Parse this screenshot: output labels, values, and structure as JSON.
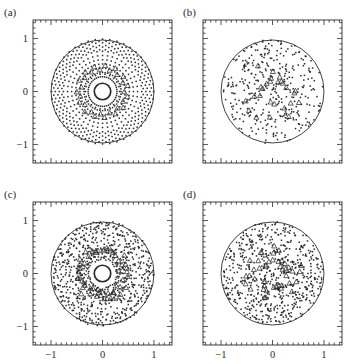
{
  "figure": {
    "layout": "2x2 grid of square scatter panels",
    "background_color": "#ffffff",
    "ink_color": "#2b2b2b"
  },
  "chart_data": [
    {
      "type": "scatter",
      "panel": "a",
      "label": "(a)",
      "title": "",
      "xlabel": "",
      "ylabel": "",
      "xlim": [
        -1.35,
        1.35
      ],
      "ylim": [
        -1.35,
        1.35
      ],
      "xticks": [
        -1,
        0,
        1
      ],
      "yticks": [
        -1,
        0,
        1
      ],
      "xticklabels": [
        "",
        "",
        ""
      ],
      "yticklabels": [
        "1",
        "0",
        "-1"
      ],
      "minor_tick_step": 0.1,
      "grid": false,
      "legend": "none",
      "annotations": [
        "unit boundary circle radius 1.0",
        "bold solid inner circle radius 0.16",
        "dotted ring of points radius 0.28",
        "regular polar lattice: 44 angular spokes",
        "triangle markers on ring radius 0.42 to 0.50"
      ],
      "boundary_circle_radius": 1.0,
      "inner_circle_radius": 0.16,
      "dotted_ring_radius": 0.28,
      "n_spokes": 44,
      "point_radii": [
        0.36,
        0.44,
        0.52,
        0.6,
        0.68,
        0.76,
        0.84,
        0.92,
        0.99
      ],
      "triangle_ring_radii": [
        0.43,
        0.5
      ],
      "n_triangles": 30,
      "jitter": 0.0,
      "marker_dot": "dot",
      "marker_special": "open-triangle"
    },
    {
      "type": "scatter",
      "panel": "b",
      "label": "(b)",
      "title": "",
      "xlabel": "",
      "ylabel": "",
      "xlim": [
        -1.35,
        1.35
      ],
      "ylim": [
        -1.35,
        1.35
      ],
      "xticks": [
        -1,
        0,
        1
      ],
      "yticks": [
        -1,
        0,
        1
      ],
      "xticklabels": [
        "",
        "",
        ""
      ],
      "yticklabels": [
        "",
        "",
        ""
      ],
      "minor_tick_step": 0.1,
      "grid": false,
      "legend": "none",
      "annotations": [
        "unit boundary circle radius 1.0",
        "no inner circle",
        "uniform random points filling the disk",
        "triangle markers scattered in central region"
      ],
      "boundary_circle_radius": 1.0,
      "inner_circle_radius": 0,
      "n_points": 360,
      "n_triangles": 26,
      "distribution": "uniform-random-disk",
      "marker_dot": "dot",
      "marker_special": "open-triangle"
    },
    {
      "type": "scatter",
      "panel": "c",
      "label": "(c)",
      "title": "",
      "xlabel": "",
      "ylabel": "",
      "xlim": [
        -1.35,
        1.35
      ],
      "ylim": [
        -1.35,
        1.35
      ],
      "xticks": [
        -1,
        0,
        1
      ],
      "yticks": [
        -1,
        0,
        1
      ],
      "xticklabels": [
        "-1",
        "0",
        "1"
      ],
      "yticklabels": [
        "1",
        "0",
        "-1"
      ],
      "minor_tick_step": 0.1,
      "grid": false,
      "legend": "none",
      "annotations": [
        "unit boundary circle radius 1.0",
        "bold solid inner circle radius 0.16",
        "faint dotted ring radius 0.28",
        "perturbed polar lattice: 44 spokes with jitter",
        "triangle markers on jittered ring radius 0.40 to 0.52"
      ],
      "boundary_circle_radius": 1.0,
      "inner_circle_radius": 0.16,
      "dotted_ring_radius": 0.28,
      "n_spokes": 44,
      "point_radii": [
        0.36,
        0.44,
        0.52,
        0.6,
        0.68,
        0.76,
        0.84,
        0.92,
        0.99
      ],
      "triangle_ring_radii": [
        0.42,
        0.5
      ],
      "n_triangles": 40,
      "jitter": 0.05,
      "marker_dot": "dot",
      "marker_special": "open-triangle"
    },
    {
      "type": "scatter",
      "panel": "d",
      "label": "(d)",
      "title": "",
      "xlabel": "",
      "ylabel": "",
      "xlim": [
        -1.35,
        1.35
      ],
      "ylim": [
        -1.35,
        1.35
      ],
      "xticks": [
        -1,
        0,
        1
      ],
      "yticks": [
        -1,
        0,
        1
      ],
      "xticklabels": [
        "-1",
        "0",
        "1"
      ],
      "yticklabels": [
        "",
        "",
        ""
      ],
      "minor_tick_step": 0.1,
      "grid": false,
      "legend": "none",
      "annotations": [
        "unit boundary circle radius 1.0",
        "no inner circle",
        "dense quasi-random points filling the disk",
        "triangle markers in a loose ring near radius 0.3 to 0.5"
      ],
      "boundary_circle_radius": 1.0,
      "inner_circle_radius": 0,
      "n_points": 620,
      "n_triangles": 44,
      "distribution": "dense-quasi-random-disk",
      "marker_dot": "dot",
      "marker_special": "open-triangle"
    }
  ]
}
